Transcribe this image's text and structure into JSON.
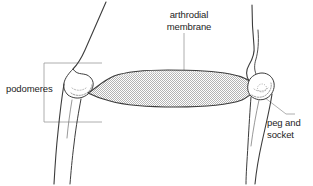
{
  "figure": {
    "type": "anatomical-diagram",
    "width": 313,
    "height": 186,
    "background_color": "#ffffff"
  },
  "labels": {
    "arthrodial_membrane": "arthrodial\nmembrane",
    "podomeres": "podomeres",
    "peg_and_socket": "peg and\nsocket"
  },
  "colors": {
    "outline": "#3a3a3a",
    "leader_line": "#8a8a8a",
    "bracket": "#8a8a8a",
    "membrane_fill": "#c9c9c9",
    "membrane_stipple": "#b0b0b0",
    "text": "#1d1d1d"
  },
  "parts": {
    "membrane_name": "arthrodial-membrane-shape",
    "left_podomere_name": "left-podomere-outline",
    "right_podomere_name": "right-podomere-outline",
    "left_condyle_name": "left-condyle",
    "right_condyle_name": "right-peg-socket"
  }
}
